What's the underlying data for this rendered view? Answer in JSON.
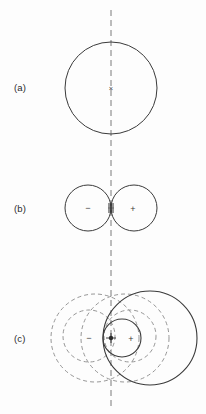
{
  "figure": {
    "background_color": "#fdfdfd",
    "stroke_color": "#3a3a3a",
    "dash_color": "#6e6e6e",
    "axis_color": "#7a7a7a",
    "width": 206,
    "height": 414
  },
  "axis": {
    "name": "vertical-dashed-axis",
    "x": 111,
    "y_top": 10,
    "y_bottom": 408,
    "dash_pattern": "6 4"
  },
  "panels": [
    {
      "id": "a",
      "label": "(a)",
      "label_x": 14,
      "label_y": 91,
      "solid_circles": [
        {
          "name": "circle-a-main",
          "cx": 111,
          "cy": 88,
          "r": 46
        }
      ],
      "dashed_circles": [],
      "markers": [
        {
          "name": "center-marker-a",
          "glyph": "×",
          "x": 111,
          "y": 88,
          "kind": "center"
        }
      ]
    },
    {
      "id": "b",
      "label": "(b)",
      "label_x": 14,
      "label_y": 212,
      "solid_circles": [
        {
          "name": "circle-b-negative",
          "cx": 88,
          "cy": 208,
          "r": 23
        },
        {
          "name": "circle-b-positive",
          "cx": 134,
          "cy": 208,
          "r": 23
        }
      ],
      "dashed_circles": [],
      "markers": [
        {
          "name": "pole-marker-negative-b",
          "glyph": "−",
          "x": 85,
          "y": 209,
          "kind": "pole"
        },
        {
          "name": "pole-marker-positive-b",
          "glyph": "+",
          "x": 129,
          "y": 210,
          "kind": "pole"
        },
        {
          "name": "tangency-marker-b",
          "glyph": "",
          "x": 111,
          "y": 208,
          "kind": "tangency"
        }
      ]
    },
    {
      "id": "c",
      "label": "(c)",
      "label_x": 14,
      "label_y": 342,
      "solid_circles": [
        {
          "name": "circle-c-large-solid",
          "cx": 150,
          "cy": 338,
          "r": 47
        },
        {
          "name": "circle-c-small-solid",
          "cx": 122,
          "cy": 338,
          "r": 19
        }
      ],
      "dashed_circles": [
        {
          "name": "dashed-circle-c-outer-left",
          "cx": 95,
          "cy": 338,
          "r": 44
        },
        {
          "name": "dashed-circle-c-inner-left",
          "cx": 89,
          "cy": 336,
          "r": 26
        },
        {
          "name": "dashed-circle-c-outer-right",
          "cx": 125,
          "cy": 338,
          "r": 44
        },
        {
          "name": "dashed-circle-c-inner-right",
          "cx": 130,
          "cy": 336,
          "r": 26
        }
      ],
      "markers": [
        {
          "name": "pole-marker-negative-c",
          "glyph": "−",
          "x": 86,
          "y": 340,
          "kind": "pole"
        },
        {
          "name": "pole-marker-positive-c",
          "glyph": "+",
          "x": 130,
          "y": 340,
          "kind": "pole"
        },
        {
          "name": "tangency-marker-c",
          "glyph": "",
          "x": 111,
          "y": 338,
          "kind": "tangency"
        }
      ]
    }
  ],
  "labels": {
    "panel_a": "(a)",
    "panel_b": "(b)",
    "panel_c": "(c)",
    "negative_pole": "−",
    "positive_pole": "+",
    "center_cross": "×"
  }
}
